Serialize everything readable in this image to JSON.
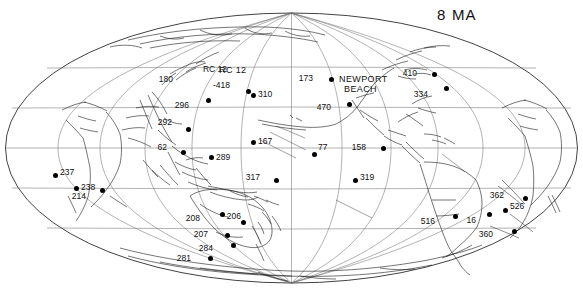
{
  "figure": {
    "title": "8 MA",
    "title_pos": {
      "x": 437,
      "y": 6
    },
    "projection": "mollweide",
    "colors": {
      "background": "#ffffff",
      "coastline": "#1a1a1a",
      "graticule": "#555555",
      "outline": "#111111",
      "site_marker": "#000000",
      "label_text": "#111111"
    },
    "map_frame": {
      "cx": 291.5,
      "cy": 148,
      "rx": 286,
      "ry": 135
    },
    "graticule": {
      "grid": true,
      "parallels": [
        60,
        30,
        0,
        -30,
        -60
      ],
      "meridians_step": 30,
      "center_longitude": 180
    }
  },
  "chart_data": {
    "type": "scatter",
    "title": "8 MA",
    "xlabel": "",
    "ylabel": "",
    "projection": "Mollweide world map centered on the Pacific Ocean",
    "marker": "filled black circle",
    "sites": [
      {
        "label": "180",
        "x": 184,
        "y": 79,
        "lx": -13,
        "ly": -4,
        "dot": false
      },
      {
        "label": "RC 12",
        "x": 239,
        "y": 71,
        "lx": -14,
        "ly": -6,
        "dot": false,
        "kind": "cruise"
      },
      {
        "label": "-418",
        "x": 248,
        "y": 91,
        "lx": -20,
        "ly": -10,
        "dot": true
      },
      {
        "label": "310",
        "x": 253,
        "y": 95,
        "lx": 5,
        "ly": -5,
        "dot": true
      },
      {
        "label": "296",
        "x": 208,
        "y": 100,
        "lx": -21,
        "ly": 1,
        "dot": true
      },
      {
        "label": "292",
        "x": 188,
        "y": 129,
        "lx": -18,
        "ly": -11,
        "dot": true
      },
      {
        "label": "62",
        "x": 183,
        "y": 152,
        "lx": -18,
        "ly": -9,
        "dot": true
      },
      {
        "label": "289",
        "x": 211,
        "y": 157,
        "lx": 5,
        "ly": -4,
        "dot": true
      },
      {
        "label": "167",
        "x": 253,
        "y": 142,
        "lx": 5,
        "ly": -5,
        "dot": true
      },
      {
        "label": "173",
        "x": 331,
        "y": 79,
        "lx": -20,
        "ly": -5,
        "dot": true
      },
      {
        "label": "470",
        "x": 349,
        "y": 104,
        "lx": -20,
        "ly": -1,
        "dot": true
      },
      {
        "label": "410",
        "x": 434,
        "y": 74,
        "lx": -19,
        "ly": -5,
        "dot": true
      },
      {
        "label": "334",
        "x": 446,
        "y": 88,
        "lx": -20,
        "ly": 2,
        "dot": true
      },
      {
        "label": "77",
        "x": 314,
        "y": 154,
        "lx": 4,
        "ly": -11,
        "dot": true
      },
      {
        "label": "158",
        "x": 383,
        "y": 148,
        "lx": -19,
        "ly": -5,
        "dot": true
      },
      {
        "label": "317",
        "x": 276,
        "y": 180,
        "lx": -18,
        "ly": -7,
        "dot": true
      },
      {
        "label": "319",
        "x": 355,
        "y": 180,
        "lx": 5,
        "ly": -7,
        "dot": true
      },
      {
        "label": "237",
        "x": 55,
        "y": 175,
        "lx": 5,
        "ly": -7,
        "dot": true
      },
      {
        "label": "238",
        "x": 76,
        "y": 188,
        "lx": 5,
        "ly": -5,
        "dot": true
      },
      {
        "label": "214",
        "x": 102,
        "y": 190,
        "lx": -18,
        "ly": 2,
        "dot": true
      },
      {
        "label": "208",
        "x": 222,
        "y": 214,
        "lx": -24,
        "ly": 0,
        "dot": true
      },
      {
        "label": "206",
        "x": 243,
        "y": 222,
        "lx": -4,
        "ly": -10,
        "dot": true
      },
      {
        "label": "207",
        "x": 227,
        "y": 235,
        "lx": -21,
        "ly": -5,
        "dot": true
      },
      {
        "label": "284",
        "x": 233,
        "y": 245,
        "lx": -22,
        "ly": -1,
        "dot": true
      },
      {
        "label": "281",
        "x": 210,
        "y": 258,
        "lx": -21,
        "ly": -4,
        "dot": true
      },
      {
        "label": "516",
        "x": 455,
        "y": 216,
        "lx": -22,
        "ly": 1,
        "dot": true
      },
      {
        "label": "16",
        "x": 489,
        "y": 214,
        "lx": -15,
        "ly": 2,
        "dot": true
      },
      {
        "label": "362",
        "x": 525,
        "y": 198,
        "lx": -23,
        "ly": -7,
        "dot": true
      },
      {
        "label": "526",
        "x": 505,
        "y": 210,
        "lx": 5,
        "ly": -8,
        "dot": true
      },
      {
        "label": "360",
        "x": 514,
        "y": 231,
        "lx": -23,
        "ly": -1,
        "dot": true
      }
    ],
    "text_annotations": [
      {
        "label": "NEWPORT",
        "x": 339,
        "y": 74
      },
      {
        "label": "BEACH",
        "x": 344,
        "y": 84
      },
      {
        "label": "RC 12",
        "x": 219,
        "y": 65
      }
    ]
  }
}
